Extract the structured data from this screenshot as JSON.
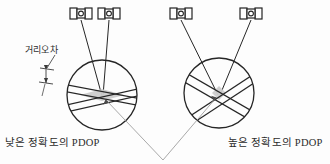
{
  "figure": {
    "background_color": "#fdfdfd",
    "line_color": "#262626",
    "shade_color": "#c9c9c9",
    "leader_color": "#8a8a8a"
  },
  "labels": {
    "range_error": "거리오차",
    "low_accuracy_pdop": "낮은 정확도의 PDOP",
    "high_accuracy_pdop": "높은 정확도의 PDOP"
  },
  "satellites": [
    {
      "id": "satellite-left-1",
      "x": 78,
      "y": 14
    },
    {
      "id": "satellite-left-2",
      "x": 106,
      "y": 14
    },
    {
      "id": "satellite-right-1",
      "x": 178,
      "y": 14
    },
    {
      "id": "satellite-right-2",
      "x": 248,
      "y": 14
    }
  ],
  "circles": [
    {
      "id": "circle-low-accuracy",
      "cx": 102,
      "cy": 95,
      "r": 35
    },
    {
      "id": "circle-high-accuracy",
      "cx": 219,
      "cy": 93,
      "r": 35
    }
  ],
  "intersections": [
    {
      "id": "uncertainty-region-low",
      "cx": 102,
      "cy": 95,
      "shape": "wide-flat-diamond"
    },
    {
      "id": "uncertainty-region-high",
      "cx": 219,
      "cy": 93,
      "shape": "small-diamond"
    }
  ],
  "leader_lines": {
    "apex_x": 163,
    "apex_y": 160
  }
}
